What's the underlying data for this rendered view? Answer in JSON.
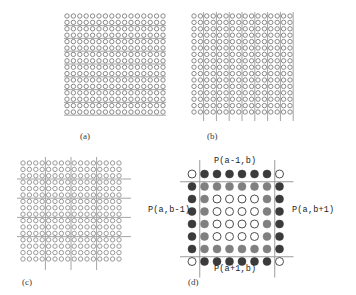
{
  "figure": {
    "caption_labels": {
      "a": "(a)",
      "b": "(b)",
      "c": "(c)",
      "d": "(d)"
    },
    "panel_d_labels": {
      "top": "P(a-1,b)",
      "left": "P(a,b-1)",
      "right": "P(a,b+1)",
      "bottom": "P(a+1,b)"
    }
  },
  "colors": {
    "line": "#9a9a9a",
    "circle_outline": "#7d7d7d",
    "circle_outline_light": "#8f8f8f",
    "fill_dark": "#3b3b3b",
    "fill_mid": "#808080",
    "fill_open": "#ffffff",
    "text": "#232323",
    "caption_text": "#3a3a3a",
    "background": "#ffffff"
  },
  "chart_data": {
    "type": "diagram",
    "title": "",
    "panels": [
      {
        "id": "a",
        "label": "(a)",
        "description": "Square lattice of open circles with horizontal partition lines between alternating rows",
        "grid_rows": 16,
        "grid_cols": 16,
        "cell_pitch": 6.4,
        "circle_radius": 2.2,
        "circle_style": "open",
        "partition_lines": {
          "orientation": "horizontal",
          "count": 8,
          "between_every_n_rows": 2,
          "row_boundaries": [
            2,
            4,
            6,
            8,
            10,
            12,
            14,
            16
          ],
          "extend_beyond_grid_px": 3
        }
      },
      {
        "id": "b",
        "label": "(b)",
        "description": "Square lattice of open circles with vertical partition lines between alternating columns, lines extend below the lattice as tick marks",
        "grid_rows": 16,
        "grid_cols": 16,
        "cell_pitch": 6.4,
        "circle_radius": 2.2,
        "circle_style": "open",
        "partition_lines": {
          "orientation": "vertical",
          "count": 8,
          "between_every_n_cols": 2,
          "col_boundaries": [
            2,
            4,
            6,
            8,
            10,
            12,
            14,
            16
          ],
          "extend_beyond_grid_px": 9
        }
      },
      {
        "id": "c",
        "label": "(c)",
        "description": "Square lattice of open circles with both horizontal and vertical partition lines forming blocks",
        "grid_rows": 16,
        "grid_cols": 16,
        "cell_pitch": 6.4,
        "circle_radius": 2.2,
        "circle_style": "open",
        "partition_lines": {
          "orientation": "both",
          "horizontal_row_boundaries": [
            3,
            6,
            9,
            12
          ],
          "vertical_col_boundaries": [
            4,
            8,
            12
          ],
          "extend_beyond_grid_px": 6
        }
      },
      {
        "id": "d",
        "label": "(d)",
        "description": "Detail of one lattice block with neighbour-block labels. 8x8 arrangement: four open corner circles, dark filled border ring, mid-grey inner ring, open core.",
        "grid_rows": 8,
        "grid_cols": 8,
        "cell_pitch": 12.5,
        "circle_radius": 4.0,
        "labels": {
          "top": "P(a-1,b)",
          "left": "P(a,b-1)",
          "right": "P(a,b+1)",
          "bottom": "P(a+1,b)"
        },
        "circle_map": [
          [
            "open",
            "dark",
            "dark",
            "dark",
            "dark",
            "dark",
            "dark",
            "open"
          ],
          [
            "dark",
            "mid",
            "mid",
            "mid",
            "mid",
            "mid",
            "mid",
            "dark"
          ],
          [
            "dark",
            "mid",
            "open",
            "open",
            "open",
            "open",
            "mid",
            "dark"
          ],
          [
            "dark",
            "mid",
            "open",
            "open",
            "open",
            "open",
            "mid",
            "dark"
          ],
          [
            "dark",
            "mid",
            "open",
            "open",
            "open",
            "open",
            "mid",
            "dark"
          ],
          [
            "dark",
            "mid",
            "open",
            "open",
            "open",
            "open",
            "mid",
            "dark"
          ],
          [
            "dark",
            "mid",
            "mid",
            "mid",
            "mid",
            "mid",
            "mid",
            "dark"
          ],
          [
            "open",
            "dark",
            "dark",
            "dark",
            "dark",
            "dark",
            "dark",
            "open"
          ]
        ],
        "separator_lines": {
          "horizontal_after_rows": [
            0,
            6
          ],
          "vertical_after_cols": [
            0,
            6
          ]
        }
      }
    ]
  }
}
